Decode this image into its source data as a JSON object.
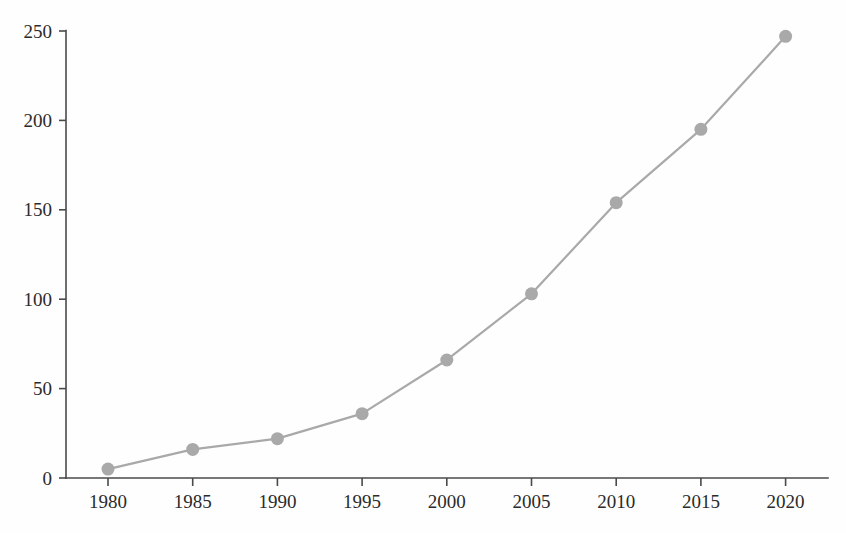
{
  "chart_data": {
    "type": "line",
    "title": "",
    "subtitle": "",
    "xlabel": "",
    "ylabel": "",
    "x": [
      1980,
      1985,
      1990,
      1995,
      2000,
      2005,
      2010,
      2015,
      2020
    ],
    "xtick_labels": [
      "1980",
      "1985",
      "1990",
      "1995",
      "2000",
      "2005",
      "2010",
      "2015",
      "2020"
    ],
    "ytick_labels": [
      "0",
      "50",
      "100",
      "150",
      "200",
      "250"
    ],
    "yticks": [
      0,
      50,
      100,
      150,
      200,
      250
    ],
    "xlim": [
      1978,
      2022
    ],
    "ylim": [
      0,
      250
    ],
    "grid": false,
    "legend": false,
    "legend_position": "none",
    "series": [
      {
        "name": "series-1",
        "color": "#a9a9a9",
        "marker": "circle",
        "values": [
          5,
          16,
          22,
          36,
          66,
          103,
          154,
          195,
          247
        ]
      }
    ],
    "annotations": []
  },
  "style": {
    "background": "#fefefe",
    "axis_color": "#4a4a4a",
    "label_color": "#2b2b2b",
    "series_color": "#a9a9a9"
  },
  "geometry": {
    "plot_left": 66,
    "plot_right": 828,
    "plot_top": 31,
    "plot_bottom": 478,
    "x_first": 108,
    "x_step": 84.7
  }
}
